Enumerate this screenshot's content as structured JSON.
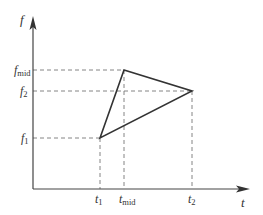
{
  "diagram": {
    "type": "time-frequency triangle plot",
    "axes": {
      "x_label": "t",
      "y_label": "f"
    },
    "y_ticks": [
      {
        "id": "f_mid",
        "base": "f",
        "sub": "mid"
      },
      {
        "id": "f2",
        "base": "f",
        "sub": "2"
      },
      {
        "id": "f1",
        "base": "f",
        "sub": "1"
      }
    ],
    "x_ticks": [
      {
        "id": "t1",
        "base": "t",
        "sub": "1"
      },
      {
        "id": "t_mid",
        "base": "t",
        "sub": "mid"
      },
      {
        "id": "t2",
        "base": "t",
        "sub": "2"
      }
    ],
    "triangle_points": [
      {
        "t": "t1",
        "f": "f1"
      },
      {
        "t": "t_mid",
        "f": "f_mid"
      },
      {
        "t": "t2",
        "f": "f2"
      }
    ],
    "colors": {
      "axis": "#444444",
      "line": "#333333",
      "dash": "#777777",
      "background": "#ffffff"
    }
  }
}
